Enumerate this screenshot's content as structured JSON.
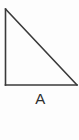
{
  "figure": {
    "name": "right-triangle-figure",
    "label": "A",
    "background_color": "#fdfdfd",
    "stroke_color": "#3a3a3a",
    "stroke_width": 1.6,
    "label_color": "#2e2e2e",
    "shape": {
      "type": "right-triangle",
      "right_angle_at": "bottom-left",
      "vertices": [
        {
          "name": "apex",
          "x": 5.5,
          "y": 9
        },
        {
          "name": "bottom-left",
          "x": 5.5,
          "y": 85
        },
        {
          "name": "bottom-right",
          "x": 77,
          "y": 85
        }
      ],
      "edges": [
        {
          "name": "vertical-leg",
          "from": "apex",
          "to": "bottom-left"
        },
        {
          "name": "horizontal-leg",
          "from": "bottom-left",
          "to": "bottom-right"
        },
        {
          "name": "hypotenuse",
          "from": "apex",
          "to": "bottom-right"
        }
      ]
    }
  }
}
